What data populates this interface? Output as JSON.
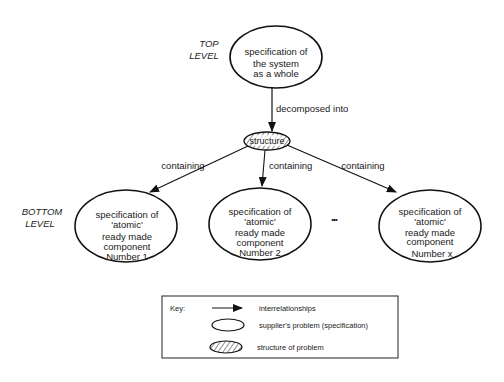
{
  "levels": {
    "top": [
      "TOP",
      "LEVEL"
    ],
    "bottom": [
      "BOTTOM",
      "LEVEL"
    ]
  },
  "top_node": {
    "lines": [
      "specification of",
      "the system",
      "as a whole"
    ]
  },
  "edge_decomposed": "decomposed into",
  "structure_node": "structure",
  "edges_containing": [
    "containing",
    "containing",
    "containing"
  ],
  "bottom_nodes": [
    {
      "lines": [
        "specification of",
        "'atomic'",
        "ready made",
        "component",
        "Number 1"
      ]
    },
    {
      "lines": [
        "specification of",
        "'atomic'",
        "ready made",
        "component",
        "Number 2"
      ]
    },
    {
      "lines": [
        "specification of",
        "'atomic'",
        "ready made",
        "component",
        "Number x"
      ]
    }
  ],
  "ellipsis": "•••",
  "key": {
    "title": "Key:",
    "items": [
      {
        "symbol": "arrow",
        "label": "interrelationships"
      },
      {
        "symbol": "ellipse",
        "label": "supplier's problem (specification)"
      },
      {
        "symbol": "hatched-ellipse",
        "label": "structure of problem"
      }
    ]
  }
}
